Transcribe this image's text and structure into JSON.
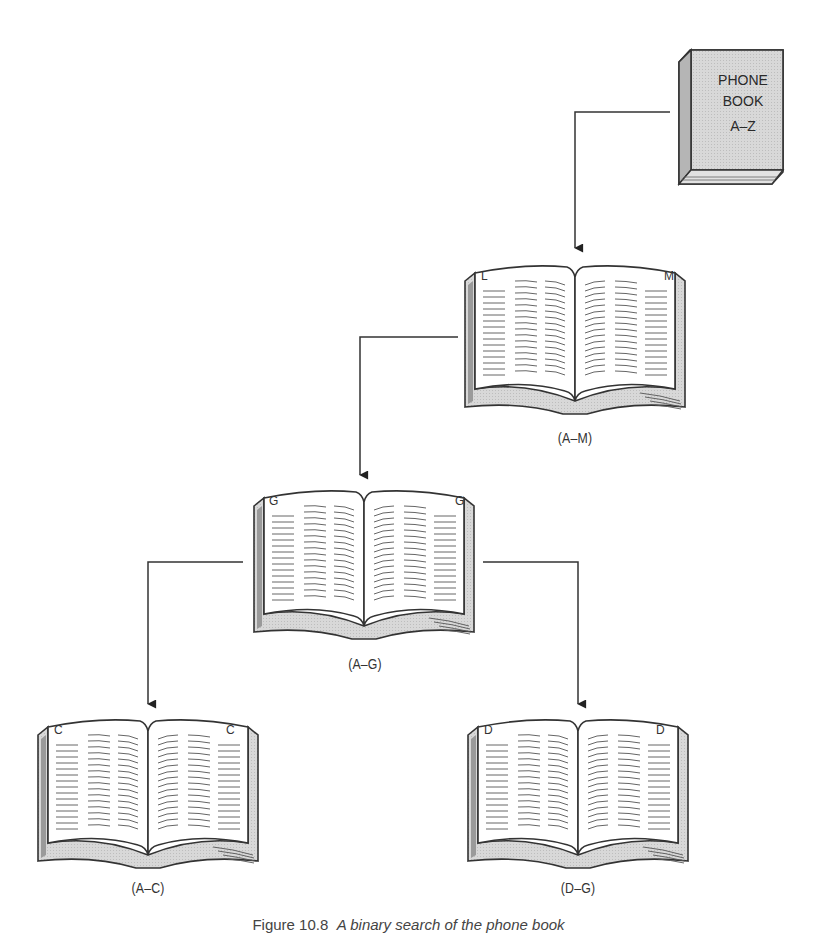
{
  "diagram": {
    "type": "binary-search-tree-of-phone-book",
    "root": {
      "name": "phone-book",
      "cover_lines": [
        "PHONE",
        "BOOK",
        "A–Z"
      ]
    },
    "nodes": [
      {
        "id": "book-a-m",
        "left_page_letter": "L",
        "right_page_letter": "M",
        "range_label": "(A–M)"
      },
      {
        "id": "book-a-g",
        "left_page_letter": "G",
        "right_page_letter": "G",
        "range_label": "(A–G)"
      },
      {
        "id": "book-a-c",
        "left_page_letter": "C",
        "right_page_letter": "C",
        "range_label": "(A–C)"
      },
      {
        "id": "book-d-g",
        "left_page_letter": "D",
        "right_page_letter": "D",
        "range_label": "(D–G)"
      }
    ],
    "edges": [
      {
        "from": "phone-book",
        "to": "book-a-m"
      },
      {
        "from": "book-a-m",
        "to": "book-a-g"
      },
      {
        "from": "book-a-g",
        "to": "book-a-c"
      },
      {
        "from": "book-a-g",
        "to": "book-d-g"
      }
    ],
    "colors": {
      "line": "#333333",
      "page_fill": "#ffffff",
      "shade": "#d6d6d6",
      "cover": "#d9d9d9"
    }
  },
  "caption": {
    "prefix": "Figure 10.8",
    "text": "A binary search of the phone book"
  }
}
